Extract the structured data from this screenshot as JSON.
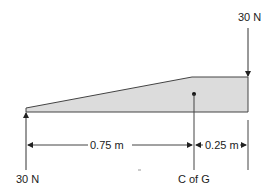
{
  "diagram": {
    "type": "free-body diagram",
    "forces": {
      "top_right": "30 N",
      "bottom_left": "30 N"
    },
    "dimensions": {
      "left_span": "0.75 m",
      "right_span": "0.25 m"
    },
    "centre_label": "C of G",
    "colors": {
      "fill": "#dcdcdc",
      "line": "#333333"
    }
  }
}
